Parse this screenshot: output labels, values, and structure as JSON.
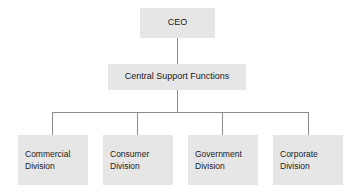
{
  "chart_data": {
    "type": "diagram",
    "title": "",
    "diagram_kind": "organizational-hierarchy",
    "orientation": "top-down",
    "levels": 3,
    "colors": {
      "node_fill": "#e6e6e6",
      "connector": "#8a8a8a",
      "text": "#1a1a1a",
      "background": "#ffffff"
    },
    "nodes": [
      {
        "id": "ceo",
        "label": "CEO",
        "level": 0,
        "parent": null
      },
      {
        "id": "central",
        "label": "Central Support Functions",
        "level": 1,
        "parent": "ceo"
      },
      {
        "id": "commercial",
        "label": "Commercial Division",
        "level": 2,
        "parent": "central"
      },
      {
        "id": "consumer",
        "label": "Consumer Division",
        "level": 2,
        "parent": "central"
      },
      {
        "id": "government",
        "label": "Government Division",
        "level": 2,
        "parent": "central"
      },
      {
        "id": "corporate",
        "label": "Corporate Division",
        "level": 2,
        "parent": "central"
      }
    ],
    "edges": [
      {
        "from": "ceo",
        "to": "central"
      },
      {
        "from": "central",
        "to": "commercial"
      },
      {
        "from": "central",
        "to": "consumer"
      },
      {
        "from": "central",
        "to": "government"
      },
      {
        "from": "central",
        "to": "corporate"
      }
    ]
  },
  "top": {
    "ceo_label": "CEO"
  },
  "middle": {
    "central_label": "Central Support Functions"
  },
  "divisions": [
    {
      "line1": "Commercial",
      "line2": "Division"
    },
    {
      "line1": "Consumer",
      "line2": "Division"
    },
    {
      "line1": "Government",
      "line2": "Division"
    },
    {
      "line1": "Corporate",
      "line2": "Division"
    }
  ]
}
